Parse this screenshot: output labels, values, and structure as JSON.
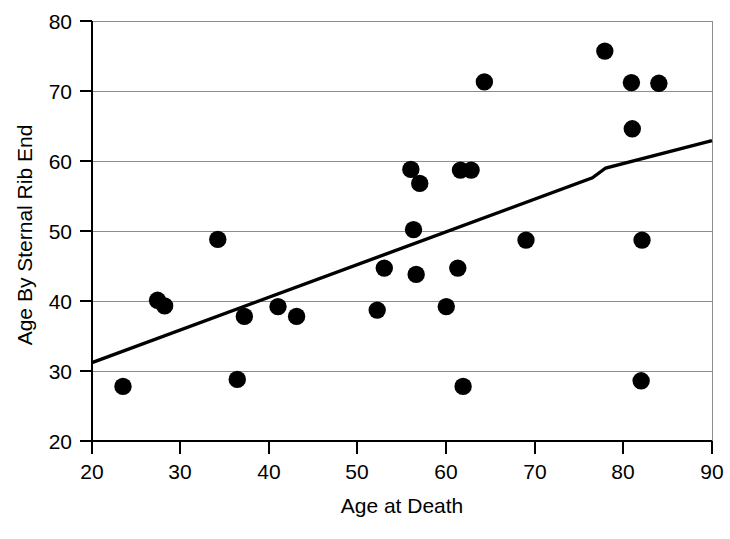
{
  "chart_data": {
    "type": "scatter",
    "title": "",
    "xlabel": "Age at Death",
    "ylabel": "Age By Sternal Rib End",
    "xlim": [
      20,
      90
    ],
    "ylim": [
      20,
      80
    ],
    "xticks": [
      20,
      30,
      40,
      50,
      60,
      70,
      80,
      90
    ],
    "yticks": [
      20,
      30,
      40,
      50,
      60,
      70,
      80
    ],
    "xtick_labels": [
      "20",
      "30",
      "40",
      "50",
      "60",
      "70",
      "80",
      "90"
    ],
    "ytick_labels": [
      "20",
      "30",
      "40",
      "50",
      "60",
      "70",
      "80"
    ],
    "grid": "horizontal",
    "legend": "none",
    "marker": "filled-circle",
    "marker_color": "#000000",
    "marker_size": 9,
    "points": [
      {
        "x": 23.5,
        "y": 27.8
      },
      {
        "x": 27.4,
        "y": 40.1
      },
      {
        "x": 28.2,
        "y": 39.3
      },
      {
        "x": 34.2,
        "y": 48.8
      },
      {
        "x": 36.4,
        "y": 28.8
      },
      {
        "x": 37.2,
        "y": 37.8
      },
      {
        "x": 41.0,
        "y": 39.2
      },
      {
        "x": 43.1,
        "y": 37.8
      },
      {
        "x": 52.2,
        "y": 38.7
      },
      {
        "x": 53.0,
        "y": 44.7
      },
      {
        "x": 56.0,
        "y": 58.8
      },
      {
        "x": 56.3,
        "y": 50.2
      },
      {
        "x": 56.6,
        "y": 43.8
      },
      {
        "x": 57.0,
        "y": 56.8
      },
      {
        "x": 60.0,
        "y": 39.2
      },
      {
        "x": 61.3,
        "y": 44.7
      },
      {
        "x": 61.6,
        "y": 58.7
      },
      {
        "x": 61.9,
        "y": 27.8
      },
      {
        "x": 62.8,
        "y": 58.7
      },
      {
        "x": 64.3,
        "y": 71.3
      },
      {
        "x": 69.0,
        "y": 48.7
      },
      {
        "x": 77.9,
        "y": 75.7
      },
      {
        "x": 80.9,
        "y": 71.2
      },
      {
        "x": 81.0,
        "y": 64.6
      },
      {
        "x": 82.0,
        "y": 28.6
      },
      {
        "x": 82.1,
        "y": 48.7
      },
      {
        "x": 84.0,
        "y": 71.1
      }
    ],
    "trend_line": {
      "type": "line",
      "color": "#000000",
      "points": [
        {
          "x": 20.0,
          "y": 31.2
        },
        {
          "x": 76.5,
          "y": 57.6
        },
        {
          "x": 78.0,
          "y": 59.0
        },
        {
          "x": 90.0,
          "y": 62.9
        }
      ]
    }
  },
  "axes": {
    "x_title": "Age at Death",
    "y_title": "Age By Sternal Rib End"
  }
}
